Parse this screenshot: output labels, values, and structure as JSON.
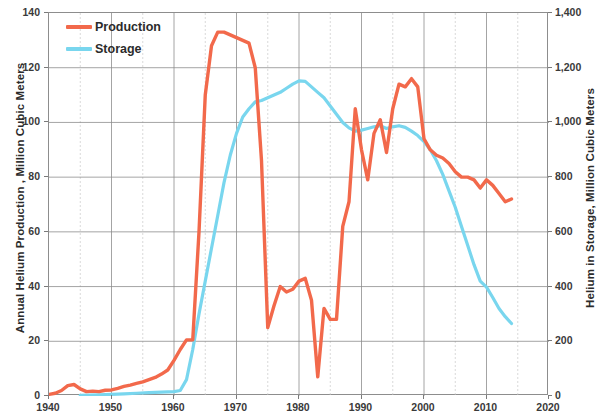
{
  "chart_data": {
    "type": "line",
    "title": "",
    "xlabel": "",
    "ylabel": "Annual Helium Production , Million Cubic Meters",
    "y2label": "Helium in Storage, Million Cubic Meters",
    "xlim": [
      1940,
      2020
    ],
    "ylim": [
      0,
      140
    ],
    "y2lim": [
      0,
      1400
    ],
    "grid": true,
    "legend_position": "top-left",
    "xticks": [
      "1940",
      "1950",
      "1960",
      "1970",
      "1980",
      "1990",
      "2000",
      "2010",
      "2020"
    ],
    "xtick_values": [
      1940,
      1950,
      1960,
      1970,
      1980,
      1990,
      2000,
      2010,
      2020
    ],
    "xminor_step": 5,
    "yticks": [
      "0",
      "20",
      "40",
      "60",
      "80",
      "100",
      "120",
      "140"
    ],
    "ytick_values": [
      0,
      20,
      40,
      60,
      80,
      100,
      120,
      140
    ],
    "y2ticks": [
      "0",
      "200",
      "400",
      "600",
      "800",
      "1,000",
      "1,200",
      "1,400"
    ],
    "y2tick_values": [
      0,
      200,
      400,
      600,
      800,
      1000,
      1200,
      1400
    ],
    "colors": {
      "production": "#F2694B",
      "storage": "#79D6EE",
      "grid_major": "#8d8d8d",
      "grid_minor": "#c9c9c9",
      "axis": "#7a7a7a",
      "text": "#2b2b2b"
    },
    "series": [
      {
        "name": "Production",
        "axis": "left",
        "color": "#F2694B",
        "x": [
          1940,
          1941,
          1942,
          1943,
          1944,
          1945,
          1946,
          1947,
          1948,
          1949,
          1950,
          1951,
          1952,
          1953,
          1954,
          1955,
          1956,
          1957,
          1958,
          1959,
          1960,
          1961,
          1962,
          1963,
          1964,
          1965,
          1966,
          1967,
          1968,
          1969,
          1970,
          1971,
          1972,
          1973,
          1974,
          1975,
          1976,
          1977,
          1978,
          1979,
          1980,
          1981,
          1982,
          1983,
          1984,
          1985,
          1986,
          1987,
          1988,
          1989,
          1990,
          1991,
          1992,
          1993,
          1994,
          1995,
          1996,
          1997,
          1998,
          1999,
          2000,
          2001,
          2002,
          2003,
          2004,
          2005,
          2006,
          2007,
          2008,
          2009,
          2010,
          2011,
          2012,
          2013,
          2014
        ],
        "values": [
          0.6,
          1.0,
          2.0,
          3.8,
          4.2,
          2.6,
          1.6,
          1.8,
          1.6,
          2.1,
          2.2,
          2.8,
          3.5,
          4.0,
          4.6,
          5.2,
          6.0,
          6.8,
          8.0,
          9.5,
          13.0,
          17.0,
          20.5,
          20.5,
          60.0,
          110.0,
          128.0,
          133.0,
          133.0,
          132.0,
          131.0,
          130.0,
          129.0,
          120.0,
          86.0,
          25.0,
          33.0,
          40.0,
          38.0,
          39.0,
          42.0,
          43.0,
          35.0,
          7.0,
          32.0,
          28.0,
          28.0,
          62.0,
          71.0,
          105.0,
          90.0,
          79.0,
          96.0,
          101.0,
          89.0,
          105.0,
          114.0,
          113.0,
          116.0,
          113.0,
          94.0,
          90.0,
          88.0,
          87.0,
          85.0,
          82.0,
          80.0,
          80.0,
          79.0,
          76.0,
          79.0,
          77.0,
          74.0,
          71.0,
          72.0
        ]
      },
      {
        "name": "Storage",
        "axis": "right",
        "color": "#79D6EE",
        "x": [
          1945,
          1948,
          1950,
          1952,
          1954,
          1956,
          1958,
          1960,
          1961,
          1962,
          1963,
          1964,
          1965,
          1966,
          1967,
          1968,
          1969,
          1970,
          1971,
          1972,
          1973,
          1974,
          1975,
          1976,
          1977,
          1978,
          1979,
          1980,
          1981,
          1982,
          1983,
          1984,
          1985,
          1986,
          1987,
          1988,
          1989,
          1990,
          1991,
          1992,
          1993,
          1994,
          1995,
          1996,
          1997,
          1998,
          1999,
          2000,
          2001,
          2002,
          2003,
          2004,
          2005,
          2006,
          2007,
          2008,
          2009,
          2010,
          2011,
          2012,
          2013,
          2014
        ],
        "values": [
          2,
          4,
          6,
          8,
          10,
          12,
          14,
          16,
          20,
          60,
          170,
          300,
          420,
          540,
          660,
          780,
          880,
          960,
          1020,
          1050,
          1075,
          1080,
          1090,
          1100,
          1110,
          1125,
          1140,
          1152,
          1150,
          1130,
          1110,
          1090,
          1060,
          1030,
          1000,
          980,
          968,
          972,
          978,
          984,
          988,
          978,
          984,
          988,
          982,
          968,
          952,
          930,
          900,
          860,
          810,
          750,
          690,
          620,
          550,
          480,
          420,
          398,
          360,
          320,
          290,
          265
        ]
      }
    ]
  },
  "axes": {
    "left_title": "Annual Helium Production , Million Cubic Meters",
    "right_title": "Helium in Storage, Million Cubic Meters",
    "left_ticks": [
      "140",
      "120",
      "100",
      "80",
      "60",
      "40",
      "20",
      "0"
    ],
    "right_ticks": [
      "1,400",
      "1,200",
      "1,000",
      "800",
      "600",
      "400",
      "200",
      "0"
    ],
    "x_ticks": [
      "1940",
      "1950",
      "1960",
      "1970",
      "1980",
      "1990",
      "2000",
      "2010",
      "2020"
    ]
  },
  "legend": {
    "items": [
      {
        "label": "Production",
        "color": "#F2694B"
      },
      {
        "label": "Storage",
        "color": "#79D6EE"
      }
    ]
  }
}
